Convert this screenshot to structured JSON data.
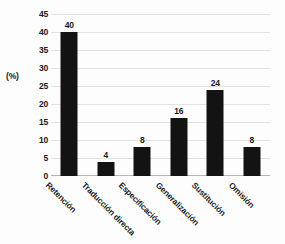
{
  "chart_data": {
    "type": "bar",
    "title": "",
    "subtitle": "",
    "xlabel": "",
    "ylabel": "(%)",
    "categories": [
      "Retención",
      "Traducción directa",
      "Especificación",
      "Generalización",
      "Sustitución",
      "Omisión"
    ],
    "values": [
      40,
      4,
      8,
      16,
      24,
      8
    ],
    "data_labels": [
      "40",
      "4",
      "8",
      "16",
      "24",
      "8"
    ],
    "ylim": [
      0,
      45
    ],
    "y_ticks": [
      0,
      5,
      10,
      15,
      20,
      25,
      30,
      35,
      40,
      45
    ],
    "y_tick_labels": [
      "0",
      "5",
      "10",
      "15",
      "20",
      "25",
      "30",
      "35",
      "40",
      "45"
    ],
    "grid": true,
    "grid_axis": "y",
    "legend": false,
    "legend_position": "none",
    "bar_color": "#131313",
    "gridline_color": "#e3e3e3",
    "axis_color": "#b5b5b5",
    "background_color": "#fdfdfd",
    "text_color": "#1a1a1a",
    "x_tick_label_rotation": 45
  }
}
